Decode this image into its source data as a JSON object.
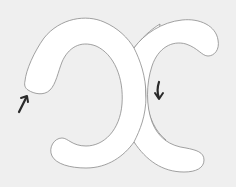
{
  "worksheet": {
    "title": "Letter x tracing guide",
    "letter": "x",
    "colors": {
      "background": "#efefef",
      "fill": "#ffffff",
      "outline": "#8a8a8a",
      "arrow": "#2a2a2a"
    },
    "arrows": [
      {
        "id": "start-arrow-left",
        "direction": "up-right"
      },
      {
        "id": "stroke-arrow-right",
        "direction": "down"
      }
    ]
  }
}
